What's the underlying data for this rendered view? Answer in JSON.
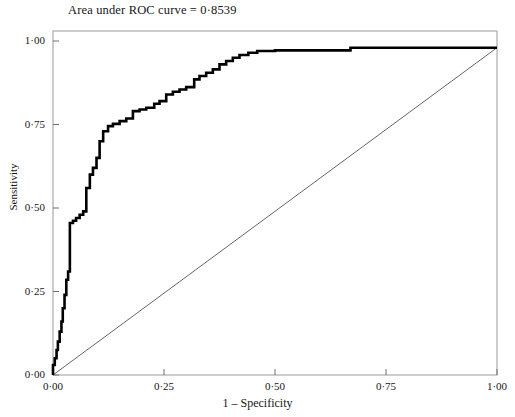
{
  "chart_data": {
    "type": "line",
    "title": "Area under ROC curve = 0·8539",
    "auc": 0.8539,
    "xlabel": "1 – Specificity",
    "ylabel": "Sensitivity",
    "xlim": [
      0,
      1
    ],
    "ylim": [
      0,
      1
    ],
    "grid": false,
    "legend": "none",
    "xticks": [
      0,
      0.25,
      0.5,
      0.75,
      1
    ],
    "yticks": [
      0,
      0.25,
      0.5,
      0.75,
      1
    ],
    "xticklabels": [
      "0·00",
      "0·25",
      "0·50",
      "0·75",
      "1·00"
    ],
    "yticklabels": [
      "0·00",
      "0·25",
      "0·50",
      "0·75",
      "1·00"
    ],
    "series": [
      {
        "name": "ROC curve",
        "style": "step",
        "color": "#000000",
        "width": 2.6,
        "x": [
          0.0,
          0.0,
          0.004,
          0.004,
          0.008,
          0.008,
          0.011,
          0.011,
          0.015,
          0.015,
          0.019,
          0.019,
          0.022,
          0.022,
          0.026,
          0.026,
          0.03,
          0.03,
          0.034,
          0.034,
          0.038,
          0.038,
          0.045,
          0.045,
          0.052,
          0.052,
          0.06,
          0.06,
          0.068,
          0.068,
          0.075,
          0.075,
          0.083,
          0.083,
          0.09,
          0.09,
          0.098,
          0.098,
          0.105,
          0.105,
          0.113,
          0.113,
          0.124,
          0.124,
          0.135,
          0.135,
          0.15,
          0.15,
          0.165,
          0.165,
          0.18,
          0.18,
          0.195,
          0.195,
          0.21,
          0.21,
          0.228,
          0.228,
          0.24,
          0.24,
          0.255,
          0.255,
          0.27,
          0.27,
          0.285,
          0.285,
          0.3,
          0.3,
          0.318,
          0.318,
          0.33,
          0.33,
          0.345,
          0.345,
          0.36,
          0.36,
          0.375,
          0.375,
          0.39,
          0.39,
          0.405,
          0.405,
          0.42,
          0.42,
          0.44,
          0.44,
          0.46,
          0.46,
          0.5,
          0.5,
          0.67,
          0.67,
          1.0
        ],
        "y": [
          0.0,
          0.03,
          0.03,
          0.05,
          0.05,
          0.075,
          0.075,
          0.1,
          0.1,
          0.13,
          0.13,
          0.16,
          0.16,
          0.2,
          0.2,
          0.24,
          0.24,
          0.285,
          0.285,
          0.31,
          0.31,
          0.455,
          0.455,
          0.462,
          0.462,
          0.47,
          0.47,
          0.48,
          0.48,
          0.49,
          0.49,
          0.56,
          0.56,
          0.6,
          0.6,
          0.62,
          0.62,
          0.65,
          0.65,
          0.7,
          0.7,
          0.73,
          0.73,
          0.745,
          0.745,
          0.752,
          0.752,
          0.76,
          0.76,
          0.768,
          0.768,
          0.79,
          0.79,
          0.795,
          0.795,
          0.8,
          0.8,
          0.812,
          0.812,
          0.82,
          0.82,
          0.84,
          0.84,
          0.848,
          0.848,
          0.855,
          0.855,
          0.862,
          0.862,
          0.885,
          0.885,
          0.895,
          0.895,
          0.905,
          0.905,
          0.915,
          0.915,
          0.93,
          0.93,
          0.94,
          0.94,
          0.95,
          0.95,
          0.958,
          0.958,
          0.965,
          0.965,
          0.97,
          0.97,
          0.972,
          0.972,
          0.98,
          0.98
        ]
      },
      {
        "name": "reference diagonal",
        "style": "line",
        "color": "#222222",
        "width": 0.7,
        "x": [
          0,
          1
        ],
        "y": [
          0,
          0.98
        ]
      }
    ]
  }
}
